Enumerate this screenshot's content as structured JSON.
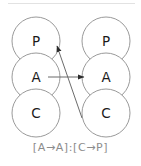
{
  "figure": {
    "caption": "[A→A]:[C→P]",
    "node_stroke_color": "#9a9a9a",
    "node_fill_color": "#ffffff",
    "edge_color": "#6b6b6b",
    "label_color": "#1a1a1a",
    "caption_color": "#8c8c8c",
    "frame_color": "#e2e2e2"
  },
  "columns": [
    {
      "name": "left-column",
      "nodes": [
        {
          "label": "P",
          "cx": 36,
          "cy": 41,
          "r": 24
        },
        {
          "label": "A",
          "cx": 36,
          "cy": 77,
          "r": 24
        },
        {
          "label": "C",
          "cx": 36,
          "cy": 113,
          "r": 24
        }
      ]
    },
    {
      "name": "right-column",
      "nodes": [
        {
          "label": "P",
          "cx": 106,
          "cy": 41,
          "r": 24
        },
        {
          "label": "A",
          "cx": 106,
          "cy": 77,
          "r": 24
        },
        {
          "label": "C",
          "cx": 106,
          "cy": 113,
          "r": 24
        }
      ]
    }
  ],
  "edges": [
    {
      "name": "edge-left-a-to-right-a",
      "from": "left-A",
      "to": "right-A",
      "x1": 48,
      "y1": 77,
      "x2": 84,
      "y2": 77
    },
    {
      "name": "edge-right-c-to-left-p",
      "from": "right-C",
      "to": "left-P",
      "x1": 82,
      "y1": 118,
      "x2": 57,
      "y2": 46
    }
  ]
}
